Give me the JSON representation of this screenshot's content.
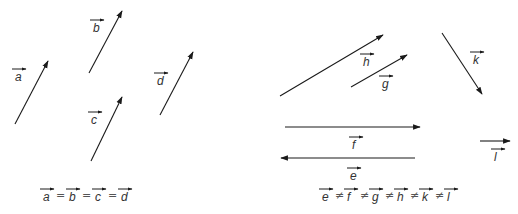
{
  "left_panel": {
    "vectors": [
      {
        "name": "a",
        "label": "a",
        "x1": 15,
        "y1": 124,
        "x2": 48,
        "y2": 61,
        "lx": 13,
        "ly": 81
      },
      {
        "name": "b",
        "label": "b",
        "x1": 89,
        "y1": 73,
        "x2": 122,
        "y2": 11,
        "lx": 91,
        "ly": 32
      },
      {
        "name": "c",
        "label": "c",
        "x1": 91,
        "y1": 161,
        "x2": 122,
        "y2": 97,
        "lx": 89,
        "ly": 124
      },
      {
        "name": "d",
        "label": "d",
        "x1": 160,
        "y1": 115,
        "x2": 193,
        "y2": 52,
        "lx": 155,
        "ly": 85
      }
    ],
    "equation": {
      "terms": [
        "a",
        "b",
        "c",
        "d"
      ],
      "operator": "=",
      "text": "a = b = c = d"
    }
  },
  "right_panel": {
    "vectors": [
      {
        "name": "h",
        "label": "h",
        "x1": 280,
        "y1": 96,
        "x2": 383,
        "y2": 35,
        "lx": 361,
        "ly": 66
      },
      {
        "name": "g",
        "label": "g",
        "x1": 351,
        "y1": 87,
        "x2": 407,
        "y2": 55,
        "lx": 380,
        "ly": 88
      },
      {
        "name": "k",
        "label": "k",
        "x1": 442,
        "y1": 33,
        "x2": 482,
        "y2": 94,
        "lx": 471,
        "ly": 64
      },
      {
        "name": "f",
        "label": "f",
        "x1": 285,
        "y1": 127,
        "x2": 420,
        "y2": 127,
        "lx": 350,
        "ly": 149
      },
      {
        "name": "e",
        "label": "e",
        "x1": 415,
        "y1": 158,
        "x2": 281,
        "y2": 158,
        "lx": 348,
        "ly": 180
      },
      {
        "name": "l",
        "label": "l",
        "x1": 480,
        "y1": 141,
        "x2": 510,
        "y2": 141,
        "lx": 492,
        "ly": 161
      }
    ],
    "equation": {
      "terms": [
        "e",
        "f",
        "g",
        "h",
        "k",
        "l"
      ],
      "operator": "≠",
      "text": "e ≠ f ≠ g ≠ h ≠ k ≠ l"
    }
  },
  "colors": {
    "line": "#1a1a1a",
    "text": "#333333",
    "background": "#ffffff"
  }
}
